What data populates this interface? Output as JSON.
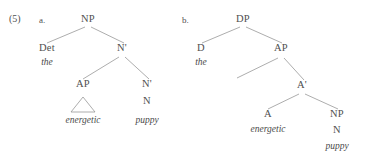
{
  "figure": {
    "example_number": "(5)",
    "colors": {
      "text": "#4f4f4f",
      "line": "#8a8a8a",
      "background": "#ffffff"
    }
  },
  "trees": [
    {
      "sub_label": "a.",
      "name": "np-analysis-tree",
      "nodes": [
        {
          "name": "np-root",
          "label": "NP",
          "x": 88,
          "y": 22
        },
        {
          "name": "det-node",
          "label": "Det",
          "x": 47,
          "y": 51
        },
        {
          "name": "nbar-upper-node",
          "label": "N'",
          "x": 122,
          "y": 51
        },
        {
          "name": "ap-node",
          "label": "AP",
          "x": 83,
          "y": 87
        },
        {
          "name": "nbar-lower-node",
          "label": "N'",
          "x": 147,
          "y": 87
        },
        {
          "name": "n-node",
          "label": "N",
          "x": 147,
          "y": 104
        }
      ],
      "terminals": [
        {
          "name": "terminal-the",
          "word": "the",
          "x": 47,
          "y": 66
        },
        {
          "name": "terminal-energetic",
          "word": "energetic",
          "x": 83,
          "y": 124
        },
        {
          "name": "terminal-puppy",
          "word": "puppy",
          "x": 147,
          "y": 124
        }
      ],
      "triangle": {
        "name": "ap-triangle",
        "cx": 83,
        "top_y": 97,
        "bottom_y": 112,
        "half_width": 12
      }
    },
    {
      "sub_label": "b.",
      "name": "dp-analysis-tree",
      "nodes": [
        {
          "name": "dp-root",
          "label": "DP",
          "x": 243,
          "y": 22
        },
        {
          "name": "d-node",
          "label": "D",
          "x": 201,
          "y": 51
        },
        {
          "name": "ap-node",
          "label": "AP",
          "x": 281,
          "y": 51
        },
        {
          "name": "abar-node",
          "label": "A'",
          "x": 302,
          "y": 88
        },
        {
          "name": "a-node",
          "label": "A",
          "x": 268,
          "y": 117
        },
        {
          "name": "np-node",
          "label": "NP",
          "x": 337,
          "y": 117
        },
        {
          "name": "n-node",
          "label": "N",
          "x": 337,
          "y": 133
        }
      ],
      "terminals": [
        {
          "name": "terminal-the",
          "word": "the",
          "x": 201,
          "y": 66
        },
        {
          "name": "terminal-energetic",
          "word": "energetic",
          "x": 268,
          "y": 133
        },
        {
          "name": "terminal-puppy",
          "word": "puppy",
          "x": 337,
          "y": 150
        }
      ],
      "triangle": null
    }
  ],
  "edges": [
    {
      "name": "edge-np-det",
      "x1": 85,
      "y1": 27,
      "x2": 47,
      "y2": 43
    },
    {
      "name": "edge-np-nbar",
      "x1": 91,
      "y1": 27,
      "x2": 124,
      "y2": 43
    },
    {
      "name": "edge-nbar-ap",
      "x1": 119,
      "y1": 57,
      "x2": 83,
      "y2": 79
    },
    {
      "name": "edge-nbar-nbar",
      "x1": 125,
      "y1": 57,
      "x2": 149,
      "y2": 79
    },
    {
      "name": "edge-dp-d",
      "x1": 240,
      "y1": 27,
      "x2": 202,
      "y2": 43
    },
    {
      "name": "edge-dp-ap",
      "x1": 246,
      "y1": 27,
      "x2": 282,
      "y2": 43
    },
    {
      "name": "edge-ap-spec",
      "x1": 278,
      "y1": 58,
      "x2": 237,
      "y2": 78
    },
    {
      "name": "edge-ap-abar",
      "x1": 284,
      "y1": 58,
      "x2": 304,
      "y2": 80
    },
    {
      "name": "edge-abar-a",
      "x1": 299,
      "y1": 94,
      "x2": 268,
      "y2": 109
    },
    {
      "name": "edge-abar-np",
      "x1": 305,
      "y1": 94,
      "x2": 338,
      "y2": 109
    }
  ]
}
